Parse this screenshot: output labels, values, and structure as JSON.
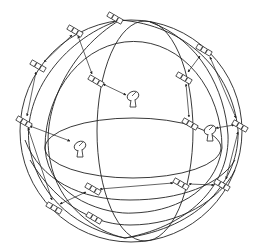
{
  "diagram": {
    "colors": {
      "line": "#222222",
      "background": "#ffffff"
    },
    "sphere": {
      "cx": 131,
      "cy": 131,
      "r": 111
    },
    "satellites": [
      {
        "x": 115,
        "y": 18
      },
      {
        "x": 75,
        "y": 31
      },
      {
        "x": 38,
        "y": 66
      },
      {
        "x": 96,
        "y": 81
      },
      {
        "x": 24,
        "y": 122
      },
      {
        "x": 204,
        "y": 50
      },
      {
        "x": 184,
        "y": 78
      },
      {
        "x": 190,
        "y": 124
      },
      {
        "x": 240,
        "y": 126
      },
      {
        "x": 93,
        "y": 189
      },
      {
        "x": 54,
        "y": 208
      },
      {
        "x": 94,
        "y": 218
      },
      {
        "x": 181,
        "y": 184
      },
      {
        "x": 222,
        "y": 185
      }
    ],
    "ground_stations": [
      {
        "x": 133,
        "y": 98
      },
      {
        "x": 80,
        "y": 148
      },
      {
        "x": 210,
        "y": 132
      }
    ],
    "icons": {
      "satellite": "satellite-icon",
      "ground_station": "satellite-dish-icon"
    }
  }
}
